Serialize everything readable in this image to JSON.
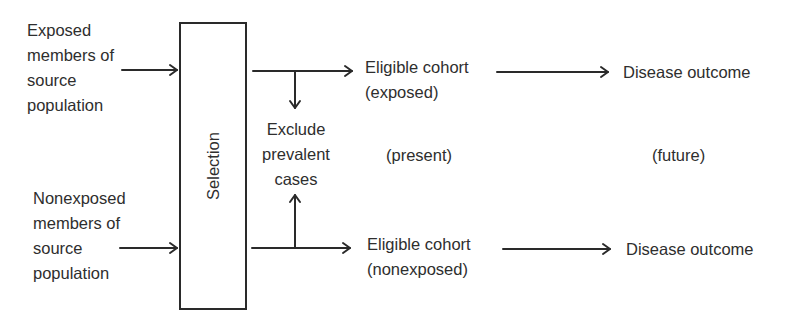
{
  "diagram": {
    "title": "",
    "sources": {
      "exposed": [
        "Exposed",
        "members of",
        "source",
        "population"
      ],
      "nonexposed": [
        "Nonexposed",
        "members of",
        "source",
        "population"
      ]
    },
    "selection_box": {
      "label": "Selection"
    },
    "exclusion": [
      "Exclude",
      "prevalent",
      "cases"
    ],
    "cohorts": {
      "exposed": [
        "Eligible cohort",
        "(exposed)"
      ],
      "nonexposed": [
        "Eligible cohort",
        "(nonexposed)"
      ]
    },
    "outcomes": {
      "exposed": "Disease outcome",
      "nonexposed": "Disease outcome"
    },
    "time_labels": {
      "present": "(present)",
      "future": "(future)"
    },
    "colors": {
      "ink": "#2e2e2e",
      "line": "#2a2a2a",
      "background": "#ffffff"
    },
    "edges": [
      {
        "from": "Exposed members of source population",
        "to": "Selection"
      },
      {
        "from": "Nonexposed members of source population",
        "to": "Selection"
      },
      {
        "from": "Selection",
        "to": "Eligible cohort (exposed)"
      },
      {
        "from": "Selection",
        "to": "Eligible cohort (nonexposed)"
      },
      {
        "from": "Selection→exposed branch",
        "to": "Exclude prevalent cases"
      },
      {
        "from": "Selection→nonexposed branch",
        "to": "Exclude prevalent cases"
      },
      {
        "from": "Eligible cohort (exposed)",
        "to": "Disease outcome"
      },
      {
        "from": "Eligible cohort (nonexposed)",
        "to": "Disease outcome"
      }
    ]
  }
}
